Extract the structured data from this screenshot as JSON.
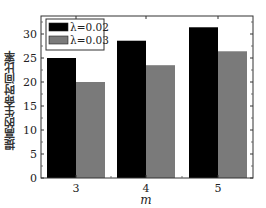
{
  "chart_data": {
    "type": "bar",
    "title": "",
    "xlabel": "m",
    "ylabel": "提高的生命时间比率",
    "categories": [
      "3",
      "4",
      "5"
    ],
    "series": [
      {
        "name": "λ=0.02",
        "color": "#000000",
        "values": [
          25.0,
          28.6,
          31.4
        ]
      },
      {
        "name": "λ=0.03",
        "color": "#7a7a7a",
        "values": [
          20.0,
          23.5,
          26.4
        ]
      }
    ],
    "ylim": [
      0,
      33.5
    ],
    "yticks": [
      0,
      5,
      10,
      15,
      20,
      25,
      30
    ],
    "grid": false,
    "legend_position": "upper left"
  },
  "labels": {
    "xlabel": "m",
    "ylabel": "提高的生命时间比率",
    "legend": [
      "λ=0.02",
      "λ=0.03"
    ]
  }
}
